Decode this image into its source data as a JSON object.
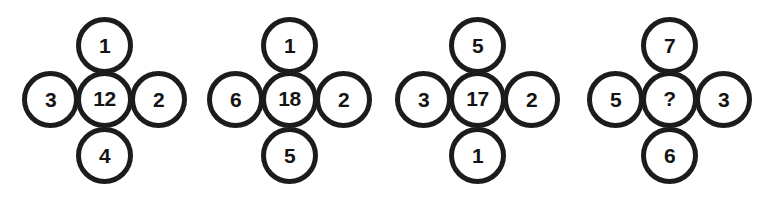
{
  "diagram": {
    "type": "number-puzzle",
    "colors": {
      "stroke": "#1c1c1c",
      "fill": "#ffffff",
      "text": "#141414",
      "background": "#ffffff"
    },
    "clusters": [
      {
        "id": "cluster-1",
        "top": "1",
        "left": "3",
        "center": "12",
        "right": "2",
        "bottom": "4"
      },
      {
        "id": "cluster-2",
        "top": "1",
        "left": "6",
        "center": "18",
        "right": "2",
        "bottom": "5"
      },
      {
        "id": "cluster-3",
        "top": "5",
        "left": "3",
        "center": "17",
        "right": "2",
        "bottom": "1"
      },
      {
        "id": "cluster-4",
        "top": "7",
        "left": "5",
        "center": "?",
        "right": "3",
        "bottom": "6"
      }
    ]
  }
}
